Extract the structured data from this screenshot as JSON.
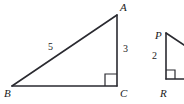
{
  "figure": {
    "stroke_color": "#2a2a30",
    "background_color": "#ffffff",
    "text_color": "#1a1a1a",
    "triangles": [
      {
        "name": "triangle-abc",
        "vertices": {
          "A": {
            "label": "A",
            "x": 117,
            "y": 15
          },
          "B": {
            "label": "B",
            "x": 12,
            "y": 86
          },
          "C": {
            "label": "C",
            "x": 117,
            "y": 86
          }
        },
        "side_labels": {
          "hypotenuse": "5",
          "vertical_leg": "3"
        },
        "right_angle_at": "C"
      },
      {
        "name": "triangle-pqr",
        "vertices": {
          "P": {
            "label": "P",
            "x": 166,
            "y": 33
          },
          "R": {
            "label": "R",
            "x": 166,
            "y": 79
          }
        },
        "side_labels": {
          "vertical_leg": "2"
        },
        "right_angle_at": "R",
        "clipped": "right edge"
      }
    ]
  }
}
